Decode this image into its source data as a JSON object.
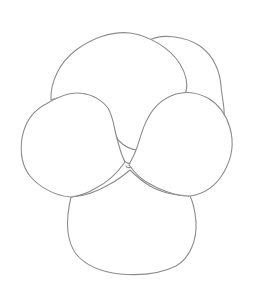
{
  "drawing": {
    "subject": "pansy flower outline",
    "style": "pencil line drawing",
    "line_color": "#8c8c8c",
    "background_color": "#ffffff",
    "petals": [
      {
        "name": "back-right-petal"
      },
      {
        "name": "back-left-petal"
      },
      {
        "name": "bottom-petal"
      },
      {
        "name": "left-side-petal"
      },
      {
        "name": "right-side-petal"
      }
    ]
  }
}
